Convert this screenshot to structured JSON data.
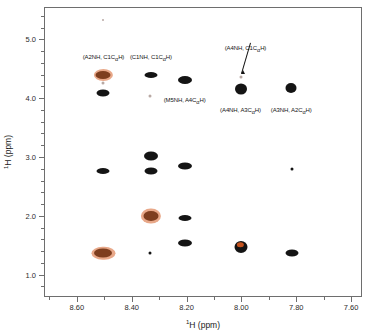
{
  "figure": {
    "kind": "2d-nmr-contour-plot",
    "background_color": "#ffffff",
    "frame_color": "#6e6e6e",
    "peak_color": "#141414",
    "peak_accent_color": "#c4521e"
  },
  "chart_data": {
    "type": "scatter",
    "title": "",
    "subtitle": "",
    "xlabel": "1H (ppm)",
    "ylabel": "1H (ppm)",
    "xlim": [
      8.72,
      7.56
    ],
    "ylim": [
      5.55,
      0.62
    ],
    "x_ticks": [
      8.6,
      8.4,
      8.2,
      8.0,
      7.8,
      7.6
    ],
    "x_tick_labels": [
      "8.60",
      "8.40",
      "8.20",
      "8.00",
      "7.80",
      "7.60"
    ],
    "x_minor_ticks": [
      8.7,
      8.5,
      8.3,
      8.1,
      7.9,
      7.7
    ],
    "y_ticks": [
      1.0,
      2.0,
      3.0,
      4.0,
      5.0
    ],
    "y_tick_labels": [
      "1.0",
      "2.0",
      "3.0",
      "4.0",
      "5.0"
    ],
    "y_minor_ticks": [
      0.8,
      1.2,
      1.4,
      1.6,
      1.8,
      2.2,
      2.4,
      2.6,
      2.8,
      3.2,
      3.4,
      3.6,
      3.8,
      4.2,
      4.4,
      4.6,
      4.8,
      5.2,
      5.4
    ],
    "grid": false,
    "legend": false,
    "axes_direction": "both-reversed",
    "points": [
      {
        "x": 8.503,
        "y": 1.36,
        "w": 18,
        "h": 9,
        "style": "halo"
      },
      {
        "x": 8.503,
        "y": 2.76,
        "w": 13,
        "h": 6,
        "style": "plain"
      },
      {
        "x": 8.503,
        "y": 4.095,
        "w": 13,
        "h": 7,
        "style": "plain"
      },
      {
        "x": 8.503,
        "y": 4.395,
        "w": 15,
        "h": 8,
        "style": "halo"
      },
      {
        "x": 8.503,
        "y": 4.255,
        "w": 3,
        "h": 3,
        "style": "faint"
      },
      {
        "x": 8.503,
        "y": 5.33,
        "w": 2,
        "h": 2,
        "style": "faint"
      },
      {
        "x": 8.333,
        "y": 1.37,
        "w": 3,
        "h": 3,
        "style": "plain"
      },
      {
        "x": 8.33,
        "y": 1.995,
        "w": 15,
        "h": 10,
        "style": "halo"
      },
      {
        "x": 8.33,
        "y": 2.76,
        "w": 13,
        "h": 7,
        "style": "plain"
      },
      {
        "x": 8.33,
        "y": 3.02,
        "w": 14,
        "h": 9,
        "style": "plain"
      },
      {
        "x": 8.33,
        "y": 4.4,
        "w": 13,
        "h": 6,
        "style": "plain"
      },
      {
        "x": 8.333,
        "y": 4.035,
        "w": 3,
        "h": 3,
        "style": "faint"
      },
      {
        "x": 8.207,
        "y": 1.545,
        "w": 14,
        "h": 7,
        "style": "plain"
      },
      {
        "x": 8.207,
        "y": 1.955,
        "w": 13,
        "h": 6,
        "style": "plain"
      },
      {
        "x": 8.207,
        "y": 2.855,
        "w": 14,
        "h": 7,
        "style": "plain"
      },
      {
        "x": 8.207,
        "y": 4.305,
        "w": 14,
        "h": 8,
        "style": "plain"
      },
      {
        "x": 8.003,
        "y": 1.465,
        "w": 13,
        "h": 12,
        "style": "core-red"
      },
      {
        "x": 8.003,
        "y": 4.16,
        "w": 12,
        "h": 11,
        "style": "plain"
      },
      {
        "x": 8.003,
        "y": 4.36,
        "w": 3,
        "h": 3,
        "style": "faint"
      },
      {
        "x": 7.817,
        "y": 1.365,
        "w": 13,
        "h": 7,
        "style": "plain"
      },
      {
        "x": 7.817,
        "y": 2.8,
        "w": 3,
        "h": 3,
        "style": "plain"
      },
      {
        "x": 7.82,
        "y": 4.165,
        "w": 11,
        "h": 10,
        "style": "plain"
      }
    ],
    "annotations": [
      {
        "id": "a2nh-c1cah",
        "text_prefix": "(A2NH, C1C",
        "text_sub": "α",
        "text_suffix": "H)",
        "x": 8.503,
        "y": 4.69,
        "leader": false
      },
      {
        "id": "c1nh-c1cah",
        "text_prefix": "(C1NH, C1C",
        "text_sub": "α",
        "text_suffix": "H)",
        "x": 8.33,
        "y": 4.69,
        "leader": false
      },
      {
        "id": "m5nh-a4cah",
        "text_prefix": "(M5NH, A4C",
        "text_sub": "α",
        "text_suffix": "H)",
        "x": 8.207,
        "y": 3.96,
        "leader": false
      },
      {
        "id": "a4nh-a3cah",
        "text_prefix": "(A4NH, A3C",
        "text_sub": "α",
        "text_suffix": "H)",
        "x": 8.003,
        "y": 3.78,
        "leader": false
      },
      {
        "id": "a3nh-a2cah",
        "text_prefix": "(A3NH, A2C",
        "text_sub": "α",
        "text_suffix": "H)",
        "x": 7.818,
        "y": 3.78,
        "leader": false
      },
      {
        "id": "a4nh-c1cah",
        "text_prefix": "(A4NH, C1C",
        "text_sub": "α",
        "text_suffix": "H)",
        "x": 7.985,
        "y": 4.835,
        "leader": true
      }
    ]
  }
}
